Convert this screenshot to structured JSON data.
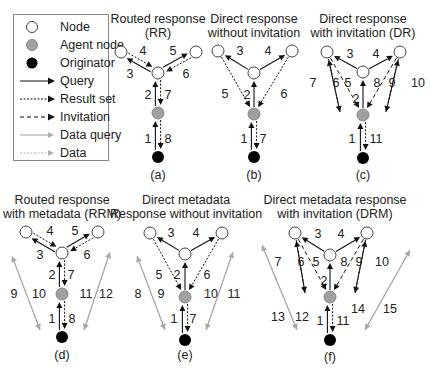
{
  "legend": {
    "items": [
      {
        "type": "node",
        "label": "Node"
      },
      {
        "type": "agent",
        "label": "Agent node"
      },
      {
        "type": "originator",
        "label": "Originator"
      },
      {
        "type": "query",
        "label": "Query"
      },
      {
        "type": "result",
        "label": "Result set"
      },
      {
        "type": "invitation",
        "label": "Invitation"
      },
      {
        "type": "data_query",
        "label": "Data query"
      },
      {
        "type": "data",
        "label": "Data"
      }
    ]
  },
  "colors": {
    "node_fill": "#ffffff",
    "agent_fill": "#a0a0a0",
    "originator_fill": "#000000",
    "arrow_black": "#111111",
    "arrow_gray": "#a8a8a8"
  },
  "panels": [
    {
      "id": "a",
      "title_line1": "Routed response",
      "title_line2": "(RR)",
      "label": "(a)",
      "arrows": [
        {
          "num": "1",
          "type": "query",
          "from": "orig",
          "to": "agent",
          "side": "left"
        },
        {
          "num": "8",
          "type": "result",
          "from": "agent",
          "to": "orig",
          "side": "right"
        },
        {
          "num": "2",
          "type": "query",
          "from": "agent",
          "to": "center",
          "side": "left"
        },
        {
          "num": "7",
          "type": "result",
          "from": "center",
          "to": "agent",
          "side": "right"
        },
        {
          "num": "3",
          "type": "query",
          "from": "center",
          "to": "tl",
          "side": "left"
        },
        {
          "num": "4",
          "type": "result",
          "from": "tl",
          "to": "center",
          "side": "right"
        },
        {
          "num": "5",
          "type": "query",
          "from": "center",
          "to": "tr",
          "side": "left"
        },
        {
          "num": "6",
          "type": "result",
          "from": "tr",
          "to": "center",
          "side": "right"
        }
      ]
    },
    {
      "id": "b",
      "title_line1": "Direct response",
      "title_line2": "without invitation",
      "label": "(b)",
      "arrows": [
        {
          "num": "1",
          "type": "query",
          "from": "orig",
          "to": "agent",
          "side": "left"
        },
        {
          "num": "7",
          "type": "result",
          "from": "agent",
          "to": "orig",
          "side": "right"
        },
        {
          "num": "2",
          "type": "query",
          "from": "agent",
          "to": "center",
          "side": "mid"
        },
        {
          "num": "3",
          "type": "query",
          "from": "center",
          "to": "tl",
          "side": "mid"
        },
        {
          "num": "4",
          "type": "query",
          "from": "center",
          "to": "tr",
          "side": "mid"
        },
        {
          "num": "5",
          "type": "result",
          "from": "tl",
          "to": "agent",
          "side": "mid"
        },
        {
          "num": "6",
          "type": "result",
          "from": "tr",
          "to": "agent",
          "side": "mid"
        }
      ]
    },
    {
      "id": "c",
      "title_line1": "Direct response",
      "title_line2": "with invitation (DR)",
      "label": "(c)",
      "arrows": [
        {
          "num": "1",
          "type": "query",
          "from": "orig",
          "to": "agent",
          "side": "left"
        },
        {
          "num": "11",
          "type": "result",
          "from": "agent",
          "to": "orig",
          "side": "right"
        },
        {
          "num": "2",
          "type": "query",
          "from": "agent",
          "to": "center",
          "side": "mid"
        },
        {
          "num": "3",
          "type": "query",
          "from": "center",
          "to": "tl",
          "side": "mid"
        },
        {
          "num": "4",
          "type": "query",
          "from": "center",
          "to": "tr",
          "side": "mid"
        },
        {
          "num": "5",
          "type": "invitation",
          "from": "tl",
          "to": "agent",
          "side": "mid"
        },
        {
          "num": "8",
          "type": "invitation",
          "from": "tr",
          "to": "agent",
          "side": "mid"
        },
        {
          "num": "6",
          "type": "query",
          "from": "lfar",
          "to": "tl",
          "side": "inner"
        },
        {
          "num": "7",
          "type": "result",
          "from": "tl",
          "to": "lfar",
          "side": "outer"
        },
        {
          "num": "9",
          "type": "query",
          "from": "rfar",
          "to": "tr",
          "side": "inner"
        },
        {
          "num": "10",
          "type": "result",
          "from": "tr",
          "to": "rfar",
          "side": "outer"
        }
      ]
    },
    {
      "id": "d",
      "title_line1": "Routed response",
      "title_line2": "with metadata (RRM)",
      "label": "(d)",
      "arrows": [
        {
          "num": "1",
          "type": "query",
          "from": "orig",
          "to": "agent",
          "side": "left"
        },
        {
          "num": "8",
          "type": "result",
          "from": "agent",
          "to": "orig",
          "side": "right"
        },
        {
          "num": "2",
          "type": "query",
          "from": "agent",
          "to": "center",
          "side": "left"
        },
        {
          "num": "7",
          "type": "result",
          "from": "center",
          "to": "agent",
          "side": "right"
        },
        {
          "num": "3",
          "type": "query",
          "from": "center",
          "to": "tl",
          "side": "left"
        },
        {
          "num": "4",
          "type": "result",
          "from": "tl",
          "to": "center",
          "side": "right"
        },
        {
          "num": "5",
          "type": "query",
          "from": "center",
          "to": "tr",
          "side": "left"
        },
        {
          "num": "6",
          "type": "result",
          "from": "tr",
          "to": "center",
          "side": "right"
        },
        {
          "num": "9",
          "type": "data",
          "from": "ltop",
          "to": "lbot",
          "side": "outer"
        },
        {
          "num": "10",
          "type": "data_query",
          "from": "lbot",
          "to": "ltop",
          "side": "inner"
        },
        {
          "num": "11",
          "type": "data_query",
          "from": "rbot",
          "to": "rtop",
          "side": "inner"
        },
        {
          "num": "12",
          "type": "data",
          "from": "rtop",
          "to": "rbot",
          "side": "outer"
        }
      ]
    },
    {
      "id": "e",
      "title_line1": "Direct metadata",
      "title_line2": "Response without invitation",
      "label": "(e)",
      "arrows": [
        {
          "num": "1",
          "type": "query",
          "from": "orig",
          "to": "agent",
          "side": "left"
        },
        {
          "num": "7",
          "type": "result",
          "from": "agent",
          "to": "orig",
          "side": "right"
        },
        {
          "num": "2",
          "type": "query",
          "from": "agent",
          "to": "center",
          "side": "mid"
        },
        {
          "num": "3",
          "type": "query",
          "from": "center",
          "to": "tl",
          "side": "mid"
        },
        {
          "num": "4",
          "type": "query",
          "from": "center",
          "to": "tr",
          "side": "mid"
        },
        {
          "num": "5",
          "type": "result",
          "from": "tl",
          "to": "agent",
          "side": "mid"
        },
        {
          "num": "6",
          "type": "result",
          "from": "tr",
          "to": "agent",
          "side": "mid"
        },
        {
          "num": "8",
          "type": "data",
          "from": "ltop",
          "to": "lbot",
          "side": "outer"
        },
        {
          "num": "9",
          "type": "data_query",
          "from": "lbot",
          "to": "ltop",
          "side": "inner"
        },
        {
          "num": "10",
          "type": "data_query",
          "from": "rbot",
          "to": "rtop",
          "side": "inner"
        },
        {
          "num": "11",
          "type": "data",
          "from": "rtop",
          "to": "rbot",
          "side": "outer"
        }
      ]
    },
    {
      "id": "f",
      "title_line1": "Direct metadata response",
      "title_line2": "with invitation (DRM)",
      "label": "(f)",
      "arrows": [
        {
          "num": "1",
          "type": "query",
          "from": "orig",
          "to": "agent",
          "side": "left"
        },
        {
          "num": "11",
          "type": "result",
          "from": "agent",
          "to": "orig",
          "side": "right"
        },
        {
          "num": "2",
          "type": "query",
          "from": "agent",
          "to": "center",
          "side": "mid"
        },
        {
          "num": "3",
          "type": "query",
          "from": "center",
          "to": "tl",
          "side": "mid"
        },
        {
          "num": "4",
          "type": "query",
          "from": "center",
          "to": "tr",
          "side": "mid"
        },
        {
          "num": "5",
          "type": "invitation",
          "from": "tl",
          "to": "agent",
          "side": "mid"
        },
        {
          "num": "8",
          "type": "invitation",
          "from": "tr",
          "to": "agent",
          "side": "mid"
        },
        {
          "num": "6",
          "type": "query",
          "from": "lfar",
          "to": "tl",
          "side": "inner"
        },
        {
          "num": "7",
          "type": "result",
          "from": "tl",
          "to": "lfar",
          "side": "outer"
        },
        {
          "num": "9",
          "type": "query",
          "from": "rfar",
          "to": "tr",
          "side": "inner"
        },
        {
          "num": "10",
          "type": "result",
          "from": "tr",
          "to": "rfar",
          "side": "outer"
        },
        {
          "num": "12",
          "type": "data_query",
          "from": "lbot",
          "to": "ltop",
          "side": "inner"
        },
        {
          "num": "13",
          "type": "data",
          "from": "ltop",
          "to": "lbot",
          "side": "outer"
        },
        {
          "num": "14",
          "type": "data_query",
          "from": "rbot",
          "to": "rtop",
          "side": "inner"
        },
        {
          "num": "15",
          "type": "data",
          "from": "rtop",
          "to": "rbot",
          "side": "outer"
        }
      ]
    }
  ]
}
